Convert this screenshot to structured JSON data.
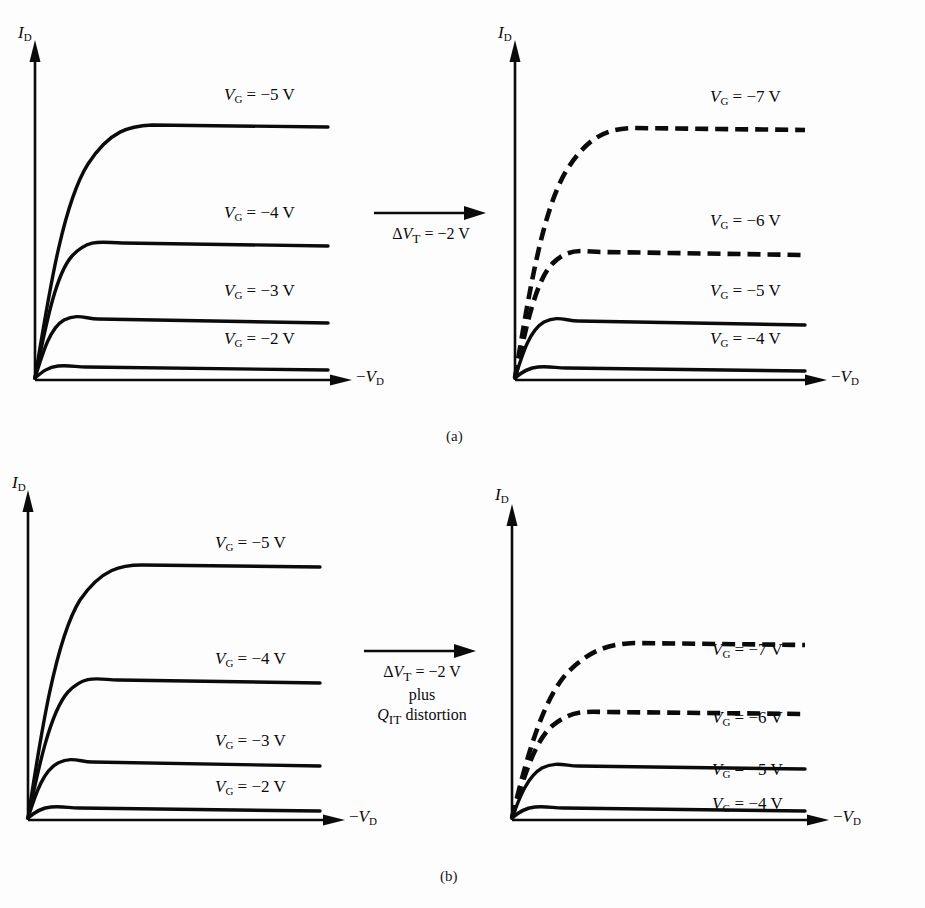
{
  "figure": {
    "background_color": "#fdfdfd",
    "ink_color": "#0b0b0b"
  },
  "axes": {
    "y_label_plain": "ID",
    "y_var": "I",
    "y_sub": "D",
    "x_label_plain": "-VD",
    "x_minus": "−",
    "x_var": "V",
    "x_sub": "D"
  },
  "captions": {
    "a": "(a)",
    "b": "(b)"
  },
  "panels": [
    {
      "id": "panel-a-left",
      "row": "a",
      "side": "left",
      "curve_labels": [
        "V_G = −5 V",
        "V_G = −4 V",
        "V_G = −3 V",
        "V_G = −2 V"
      ],
      "curves": [
        {
          "label_plain": "VG = -5 V",
          "var": "V",
          "sub": "G",
          "eq": "=",
          "value": "−5 V",
          "style": "solid"
        },
        {
          "label_plain": "VG = -4 V",
          "var": "V",
          "sub": "G",
          "eq": "=",
          "value": "−4 V",
          "style": "solid"
        },
        {
          "label_plain": "VG = -3 V",
          "var": "V",
          "sub": "G",
          "eq": "=",
          "value": "−3 V",
          "style": "solid"
        },
        {
          "label_plain": "VG = -2 V",
          "var": "V",
          "sub": "G",
          "eq": "=",
          "value": "−2 V",
          "style": "solid"
        }
      ]
    },
    {
      "id": "panel-a-right",
      "row": "a",
      "side": "right",
      "curve_labels": [
        "V_G = −7 V",
        "V_G = −6 V",
        "V_G = −5 V",
        "V_G = −4 V"
      ],
      "curves": [
        {
          "label_plain": "VG = -7 V",
          "var": "V",
          "sub": "G",
          "eq": "=",
          "value": "−7 V",
          "style": "dashed"
        },
        {
          "label_plain": "VG = -6 V",
          "var": "V",
          "sub": "G",
          "eq": "=",
          "value": "−6 V",
          "style": "dashed"
        },
        {
          "label_plain": "VG = -5 V",
          "var": "V",
          "sub": "G",
          "eq": "=",
          "value": "−5 V",
          "style": "solid"
        },
        {
          "label_plain": "VG = -4 V",
          "var": "V",
          "sub": "G",
          "eq": "=",
          "value": "−4 V",
          "style": "solid"
        }
      ]
    },
    {
      "id": "panel-b-left",
      "row": "b",
      "side": "left",
      "curve_labels": [
        "V_G = −5 V",
        "V_G = −4 V",
        "V_G = −3 V",
        "V_G = −2 V"
      ],
      "curves": [
        {
          "label_plain": "VG = -5 V",
          "var": "V",
          "sub": "G",
          "eq": "=",
          "value": "−5 V",
          "style": "solid"
        },
        {
          "label_plain": "VG = -4 V",
          "var": "V",
          "sub": "G",
          "eq": "=",
          "value": "−4 V",
          "style": "solid"
        },
        {
          "label_plain": "VG = -3 V",
          "var": "V",
          "sub": "G",
          "eq": "=",
          "value": "−3 V",
          "style": "solid"
        },
        {
          "label_plain": "VG = -2 V",
          "var": "V",
          "sub": "G",
          "eq": "=",
          "value": "−2 V",
          "style": "solid"
        }
      ]
    },
    {
      "id": "panel-b-right",
      "row": "b",
      "side": "right",
      "curve_labels": [
        "V_G = −7 V",
        "V_G = −6 V",
        "V_G = −5 V",
        "V_G = −4 V"
      ],
      "curves": [
        {
          "label_plain": "VG = -7 V",
          "var": "V",
          "sub": "G",
          "eq": "=",
          "value": "−7 V",
          "style": "dashed"
        },
        {
          "label_plain": "VG = -6 V",
          "var": "V",
          "sub": "G",
          "eq": "=",
          "value": "−6 V",
          "style": "dashed"
        },
        {
          "label_plain": "VG = -5 V",
          "var": "V",
          "sub": "G",
          "eq": "=",
          "value": "−5 V",
          "style": "solid"
        },
        {
          "label_plain": "VG = -4 V",
          "var": "V",
          "sub": "G",
          "eq": "=",
          "value": "−4 V",
          "style": "solid"
        }
      ]
    }
  ],
  "annotations": {
    "a_arrow": {
      "lines": [
        "ΔV_T = −2 V"
      ],
      "delta": "Δ",
      "var": "V",
      "sub": "T",
      "eq": "=",
      "value": "−2 V"
    },
    "b_arrow": {
      "lines": [
        "ΔV_T = −2 V",
        "plus",
        "Q_IT distortion"
      ],
      "delta": "Δ",
      "var": "V",
      "sub": "T",
      "eq": "=",
      "value": "−2 V",
      "line2": "plus",
      "q_var": "Q",
      "q_sub": "IT",
      "line3_tail": "distortion"
    }
  },
  "chart_data": {
    "type": "line",
    "xlabel": "−V_D",
    "ylabel": "I_D",
    "grid": false,
    "legend": "inline curve labels",
    "axis_ranges": {
      "x": [
        0,
        1
      ],
      "y": [
        0,
        1
      ]
    },
    "subplots": [
      {
        "id": "panel-a-left",
        "caption": "(a)",
        "position": "top-left",
        "description": "Ideal p-channel MOSFET drain characteristics before threshold shift",
        "series": [
          {
            "name": "V_G = −5 V",
            "style": "solid",
            "saturation_level": 0.86,
            "knee_x": 0.33
          },
          {
            "name": "V_G = −4 V",
            "style": "solid",
            "saturation_level": 0.54,
            "knee_x": 0.25
          },
          {
            "name": "V_G = −3 V",
            "style": "solid",
            "saturation_level": 0.31,
            "knee_x": 0.18
          },
          {
            "name": "V_G = −2 V",
            "style": "solid",
            "saturation_level": 0.08,
            "knee_x": 0.11
          }
        ]
      },
      {
        "id": "panel-a-right",
        "caption": "(a)",
        "position": "top-right",
        "description": "Characteristics after a threshold-voltage shift of −2 V; curves relabelled by 2 V, shifted pair shown dashed",
        "series": [
          {
            "name": "V_G = −7 V",
            "style": "dashed",
            "saturation_level": 0.85,
            "knee_x": 0.33
          },
          {
            "name": "V_G = −6 V",
            "style": "dashed",
            "saturation_level": 0.52,
            "knee_x": 0.25
          },
          {
            "name": "V_G = −5 V",
            "style": "solid",
            "saturation_level": 0.31,
            "knee_x": 0.18
          },
          {
            "name": "V_G = −4 V",
            "style": "solid",
            "saturation_level": 0.07,
            "knee_x": 0.11
          }
        ]
      },
      {
        "id": "panel-b-left",
        "caption": "(b)",
        "position": "bottom-left",
        "description": "Ideal drain characteristics before threshold shift plus interface-trap distortion",
        "series": [
          {
            "name": "V_G = −5 V",
            "style": "solid",
            "saturation_level": 0.85,
            "knee_x": 0.3
          },
          {
            "name": "V_G = −4 V",
            "style": "solid",
            "saturation_level": 0.56,
            "knee_x": 0.23
          },
          {
            "name": "V_G = −3 V",
            "style": "solid",
            "saturation_level": 0.33,
            "knee_x": 0.16
          },
          {
            "name": "V_G = −2 V",
            "style": "solid",
            "saturation_level": 0.09,
            "knee_x": 0.1
          }
        ]
      },
      {
        "id": "panel-b-right",
        "caption": "(b)",
        "position": "bottom-right",
        "description": "Characteristics after −2 V threshold shift plus Q_IT distortion: curves compressed together",
        "series": [
          {
            "name": "V_G = −7 V",
            "style": "dashed",
            "saturation_level": 0.57,
            "knee_x": 0.32
          },
          {
            "name": "V_G = −6 V",
            "style": "dashed",
            "saturation_level": 0.37,
            "knee_x": 0.25
          },
          {
            "name": "V_G = −5 V",
            "style": "solid",
            "saturation_level": 0.21,
            "knee_x": 0.17
          },
          {
            "name": "V_G = −4 V",
            "style": "solid",
            "saturation_level": 0.06,
            "knee_x": 0.1
          }
        ]
      }
    ]
  }
}
